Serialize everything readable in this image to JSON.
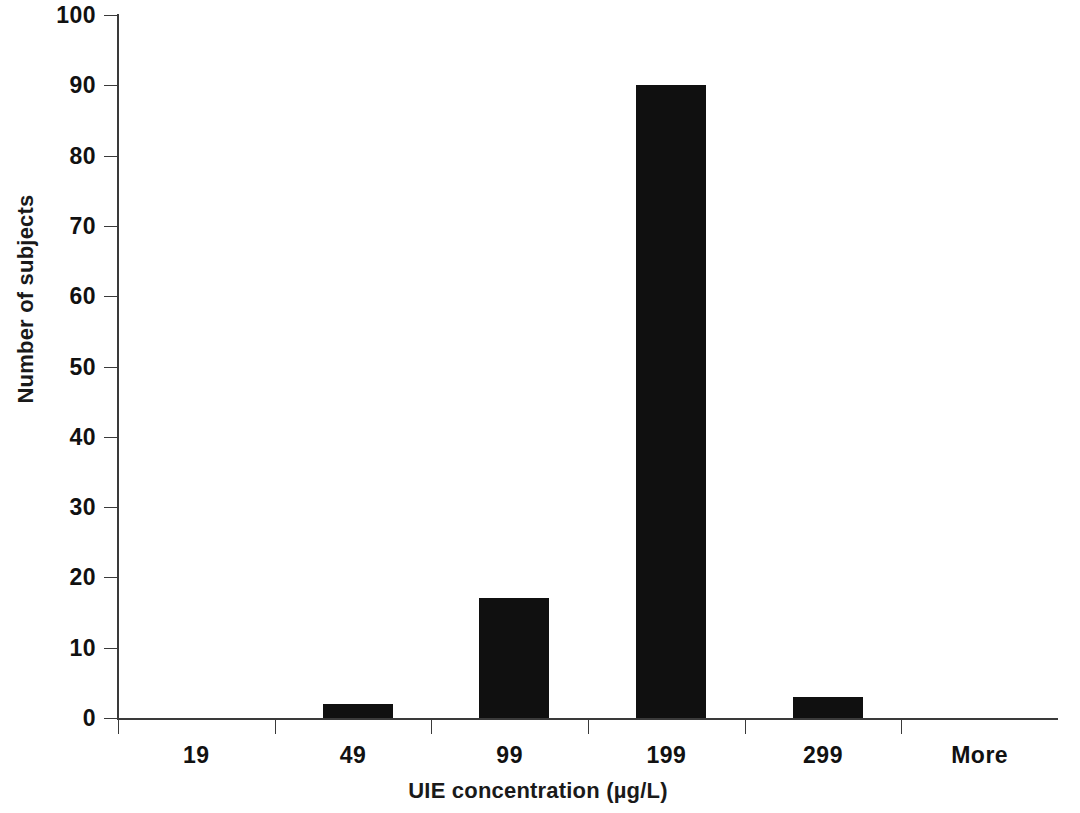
{
  "chart_data": {
    "type": "bar",
    "title": "",
    "subtitle": "",
    "xlabel": "UIE concentration (µg/L)",
    "ylabel": "Number of subjects",
    "categories": [
      "19",
      "49",
      "99",
      "199",
      "299",
      "More"
    ],
    "values": [
      0,
      2,
      17,
      90,
      3,
      0
    ],
    "series": [
      {
        "name": "Number of subjects",
        "values": [
          0,
          2,
          17,
          90,
          3,
          0
        ]
      }
    ],
    "ylim": [
      0,
      100
    ],
    "ytick_labels": [
      "0",
      "10",
      "20",
      "30",
      "40",
      "50",
      "60",
      "70",
      "80",
      "90",
      "100"
    ],
    "ytick_values": [
      0,
      10,
      20,
      30,
      40,
      50,
      60,
      70,
      80,
      90,
      100
    ],
    "xtick_labels": [
      "19",
      "49",
      "99",
      "199",
      "299",
      "More"
    ],
    "grid": false,
    "legend": false,
    "legend_position": "none",
    "bar_color": "#101010",
    "axis_color": "#3a3a3a",
    "background_color": "#ffffff",
    "annotations": []
  },
  "figure": {
    "background_color": "#ffffff",
    "axis_color": "#3a3a3a",
    "text_color": "#111111"
  }
}
